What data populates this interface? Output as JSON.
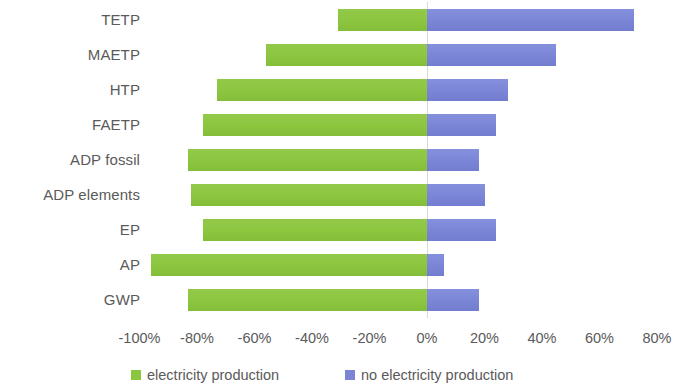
{
  "chart_data": {
    "type": "bar",
    "orientation": "horizontal",
    "title": "",
    "subtitle": "",
    "xlabel": "",
    "ylabel": "",
    "xlim": [
      -110,
      80
    ],
    "grid": false,
    "zero_line": true,
    "legend_position": "bottom",
    "categories": [
      "TETP",
      "MAETP",
      "HTP",
      "FAETP",
      "ADP fossil",
      "ADP elements",
      "EP",
      "AP",
      "GWP"
    ],
    "tick_labels": [
      "-100%",
      "-80%",
      "-60%",
      "-40%",
      "-20%",
      "0%",
      "20%",
      "40%",
      "60%",
      "80%"
    ],
    "tick_values": [
      -100,
      -80,
      -60,
      -40,
      -20,
      0,
      20,
      40,
      60,
      80
    ],
    "series": [
      {
        "name": "electricity production",
        "color": "#8cc63f",
        "values": [
          -31,
          -56,
          -73,
          -78,
          -83,
          -82,
          -78,
          -96,
          -83
        ]
      },
      {
        "name": "no electricity production",
        "color": "#7a85d6",
        "values": [
          72,
          45,
          28,
          24,
          18,
          20,
          24,
          6,
          18
        ]
      }
    ]
  },
  "legend": {
    "items": [
      {
        "label": "electricity production",
        "color": "#8cc63f",
        "swatch": "green"
      },
      {
        "label": "no electricity production",
        "color": "#7a85d6",
        "swatch": "blue"
      }
    ]
  }
}
